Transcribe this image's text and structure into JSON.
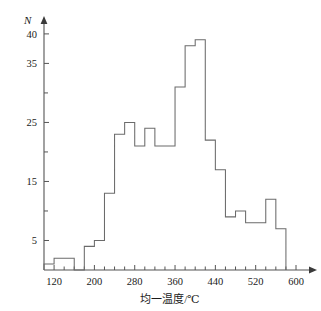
{
  "chart_data": {
    "type": "bar",
    "title": "",
    "subtitle": "",
    "xlabel": "均一温度/℃",
    "ylabel": "N",
    "xlim": [
      100,
      600
    ],
    "ylim": [
      0,
      41
    ],
    "bin_width": 20,
    "grid": false,
    "legend": null,
    "x_ticks_major": [
      120,
      200,
      280,
      360,
      440,
      520,
      600
    ],
    "x_tick_labels": [
      "120",
      "200",
      "280",
      "360",
      "440",
      "520",
      "600"
    ],
    "x_ticks_minor": [
      140,
      160,
      180,
      220,
      240,
      260,
      300,
      320,
      340,
      380,
      400,
      420,
      460,
      480,
      500,
      540,
      560,
      580
    ],
    "y_ticks_major": [
      5,
      15,
      25,
      35,
      40
    ],
    "y_tick_labels": [
      "5",
      "15",
      "25",
      "35",
      "40"
    ],
    "y_ticks_minor": [
      10,
      20,
      30
    ],
    "categories": [
      "100-120",
      "120-140",
      "140-160",
      "160-180",
      "180-200",
      "200-220",
      "220-240",
      "240-260",
      "260-280",
      "280-300",
      "300-320",
      "320-340",
      "340-360",
      "360-380",
      "380-400",
      "400-420",
      "420-440",
      "440-460",
      "460-480",
      "480-500",
      "500-520",
      "520-540",
      "540-560",
      "560-580"
    ],
    "bin_starts": [
      100,
      120,
      140,
      160,
      180,
      200,
      220,
      240,
      260,
      280,
      300,
      320,
      340,
      360,
      380,
      400,
      420,
      440,
      460,
      480,
      500,
      520,
      540,
      560
    ],
    "values": [
      1,
      2,
      2,
      0,
      4,
      5,
      13,
      23,
      25,
      21,
      24,
      21,
      21,
      31,
      38,
      39,
      22,
      17,
      9,
      10,
      8,
      8,
      12,
      7
    ]
  }
}
